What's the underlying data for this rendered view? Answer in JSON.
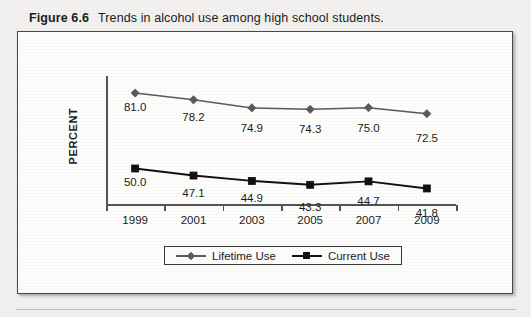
{
  "caption": {
    "figure_number": "Figure 6.6",
    "title": "Trends in alcohol use among high school students."
  },
  "chart_data": {
    "type": "line",
    "title": "Trends in alcohol use among high school students.",
    "xlabel": "",
    "ylabel": "PERCENT",
    "categories": [
      "1999",
      "2001",
      "2003",
      "2005",
      "2007",
      "2009"
    ],
    "series": [
      {
        "name": "Lifetime Use",
        "marker": "diamond",
        "color": "#5a5a5a",
        "values": [
          81.0,
          78.2,
          74.9,
          74.3,
          75.0,
          72.5
        ],
        "labels": [
          "81.0",
          "78.2",
          "74.9",
          "74.3",
          "75.0",
          "72.5"
        ]
      },
      {
        "name": "Current Use",
        "marker": "square",
        "color": "#111111",
        "values": [
          50.0,
          47.1,
          44.9,
          43.3,
          44.7,
          41.8
        ],
        "labels": [
          "50.0",
          "47.1",
          "44.9",
          "43.3",
          "44.7",
          "41.8"
        ]
      }
    ],
    "ylim": [
      35,
      88
    ],
    "grid": false,
    "legend_position": "bottom",
    "data_labels_shown": true
  }
}
